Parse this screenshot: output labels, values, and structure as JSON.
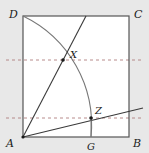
{
  "figure": {
    "name": "square-with-arc-and-cevians",
    "background_color": "#e8e8e8",
    "interior_color": "#ffffff",
    "square": {
      "name": "ABCD",
      "left": 23,
      "top": 16,
      "right": 129,
      "bottom": 137,
      "stroke_color": "#555555",
      "stroke_width": 1.2
    },
    "vertices": [
      {
        "id": "D",
        "label": "D",
        "x": 23,
        "y": 16,
        "label_x": 9,
        "label_y": 14
      },
      {
        "id": "C",
        "label": "C",
        "x": 129,
        "y": 16,
        "label_x": 134,
        "label_y": 14
      },
      {
        "id": "A",
        "label": "A",
        "x": 23,
        "y": 137,
        "label_x": 7,
        "label_y": 147
      },
      {
        "id": "B",
        "label": "B",
        "x": 129,
        "y": 137,
        "label_x": 134,
        "label_y": 147
      }
    ],
    "points": [
      {
        "id": "X",
        "label": "X",
        "x": 63,
        "y": 60,
        "label_x": 70,
        "label_y": 56,
        "marker": true
      },
      {
        "id": "Z",
        "label": "Z",
        "x": 91,
        "y": 118,
        "label_x": 95,
        "label_y": 112,
        "marker": true
      },
      {
        "id": "G",
        "label": "G",
        "x": 91,
        "y": 137,
        "label_x": 87,
        "label_y": 149,
        "marker": false
      }
    ],
    "arc": {
      "name": "arc-D-to-G",
      "center_x": 23,
      "center_y": 137,
      "radius": 121,
      "start_x": 23,
      "start_y": 16,
      "end_x": 91,
      "end_y": 137,
      "stroke_color": "#777777",
      "stroke_width": 1.1
    },
    "segments": [
      {
        "name": "line-A-to-X-extended",
        "x1": 23,
        "y1": 137,
        "x2": 86,
        "y2": 16,
        "stroke_color": "#3a3a3a",
        "stroke_width": 1.1
      },
      {
        "name": "line-A-to-Z-extended",
        "x1": 23,
        "y1": 137,
        "x2": 141,
        "y2": 108,
        "stroke_color": "#3a3a3a",
        "stroke_width": 1.1
      },
      {
        "name": "segment-Z-to-G",
        "x1": 91,
        "y1": 118,
        "x2": 91,
        "y2": 137,
        "stroke_color": "#777777",
        "stroke_width": 1.0
      }
    ],
    "dashed_lines": [
      {
        "name": "dashed-line-through-X",
        "x1": 6,
        "y1": 60,
        "x2": 144,
        "y2": 60,
        "stroke_color": "#b08080",
        "stroke_width": 0.9,
        "dash": "3,3"
      },
      {
        "name": "dashed-line-through-Z",
        "x1": 6,
        "y1": 118,
        "x2": 144,
        "y2": 118,
        "stroke_color": "#b08080",
        "stroke_width": 0.9,
        "dash": "3,3"
      }
    ]
  }
}
